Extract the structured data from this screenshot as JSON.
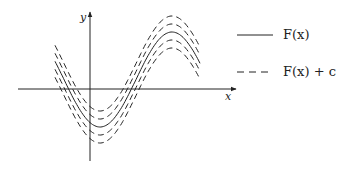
{
  "diagram": {
    "axes": {
      "x_label": "x",
      "y_label": "y"
    },
    "curves": {
      "solid": {
        "name": "F(x)",
        "style": "solid"
      },
      "dashed": {
        "name": "F(x) + c",
        "style": "dashed",
        "count": 4,
        "offsets": [
          -16,
          -8,
          8,
          16
        ]
      }
    },
    "legend": [
      {
        "line_style": "solid",
        "label": "F(x)"
      },
      {
        "line_style": "dashed",
        "label": "F(x) + c"
      }
    ],
    "colors": {
      "ink": "#222222",
      "background": "#ffffff"
    }
  }
}
